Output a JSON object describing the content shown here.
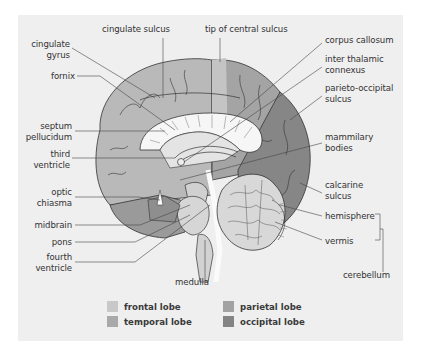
{
  "diagram": {
    "type": "anatomical-cross-section",
    "labels_left": [
      {
        "id": "cingulate-gyrus",
        "text_line1": "cingulate",
        "text_line2": "gyrus"
      },
      {
        "id": "fornix",
        "text_line1": "fornix",
        "text_line2": ""
      },
      {
        "id": "septum-pellucidum",
        "text_line1": "septum",
        "text_line2": "pellucidum"
      },
      {
        "id": "third-ventricle",
        "text_line1": "third",
        "text_line2": "ventricle"
      },
      {
        "id": "optic-chiasma",
        "text_line1": "optic",
        "text_line2": "chiasma"
      },
      {
        "id": "midbrain",
        "text_line1": "midbrain",
        "text_line2": ""
      },
      {
        "id": "pons",
        "text_line1": "pons",
        "text_line2": ""
      },
      {
        "id": "fourth-ventricle",
        "text_line1": "fourth",
        "text_line2": "ventricle"
      }
    ],
    "labels_top": [
      {
        "id": "cingulate-sulcus",
        "text": "cingulate sulcus"
      },
      {
        "id": "tip-of-central-sulcus",
        "text": "tip of central sulcus"
      }
    ],
    "labels_right": [
      {
        "id": "corpus-callosum",
        "text_line1": "corpus callosum",
        "text_line2": ""
      },
      {
        "id": "inter-thalamic-connexus",
        "text_line1": "inter thalamic",
        "text_line2": "connexus"
      },
      {
        "id": "parieto-occipital-sulcus",
        "text_line1": "parieto-occipital",
        "text_line2": "sulcus"
      },
      {
        "id": "mammilary-bodies",
        "text_line1": "mammilary",
        "text_line2": "bodies"
      },
      {
        "id": "calcarine-sulcus",
        "text_line1": "calcarine",
        "text_line2": "sulcus"
      },
      {
        "id": "hemisphere",
        "text_line1": "hemisphere",
        "text_line2": ""
      },
      {
        "id": "vermis",
        "text_line1": "vermis",
        "text_line2": ""
      }
    ],
    "labels_bottom": [
      {
        "id": "medulla",
        "text": "medulla"
      },
      {
        "id": "cerebellum",
        "text": "cerebellum"
      }
    ],
    "legend": [
      {
        "label": "frontal lobe",
        "color": "#c8c8c8"
      },
      {
        "label": "temporal lobe",
        "color": "#a9a9a9"
      },
      {
        "label": "parietal lobe",
        "color": "#a2a2a2"
      },
      {
        "label": "occipital lobe",
        "color": "#848484"
      }
    ],
    "colors": {
      "panel_bg": "#efefef",
      "frontal": "#b9b9b9",
      "parietal": "#a4a4a4",
      "occipital": "#868686",
      "temporal": "#9a9a9a",
      "white_matter": "#e8e8e8",
      "outline": "#333333",
      "leader_line": "#444444"
    }
  }
}
